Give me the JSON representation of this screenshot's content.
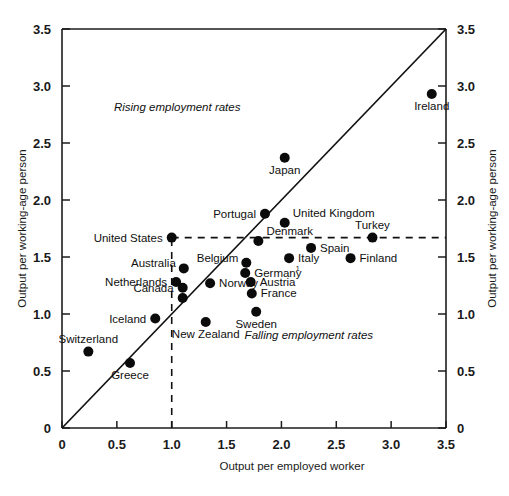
{
  "chart_data": {
    "type": "scatter",
    "title": "",
    "xlabel": "Output per employed worker",
    "ylabel": "Output per working-age person",
    "ylabel_right": "Output per working-age person",
    "xlim": [
      0,
      3.5
    ],
    "ylim": [
      0,
      3.5
    ],
    "xticks": [
      "0",
      "0.5",
      "1.0",
      "1.5",
      "2.0",
      "2.5",
      "3.0",
      "3.5"
    ],
    "xtick_values": [
      0,
      0.5,
      1.0,
      1.5,
      2.0,
      2.5,
      3.0,
      3.5
    ],
    "yticks": [
      "0",
      "0.5",
      "1.0",
      "1.5",
      "2.0",
      "2.5",
      "3.0",
      "3.5"
    ],
    "ytick_values": [
      0,
      0.5,
      1.0,
      1.5,
      2.0,
      2.5,
      3.0,
      3.5
    ],
    "grid": false,
    "legend": "none",
    "reference_line": {
      "name": "45-degree-line",
      "from": [
        0,
        0
      ],
      "to": [
        3.5,
        3.5
      ],
      "style": "solid"
    },
    "guide_lines": [
      {
        "name": "united-states-horizontal-guide",
        "orientation": "horizontal",
        "value": 1.67,
        "from_x": 1.0,
        "to_x": 3.5,
        "style": "dashed"
      },
      {
        "name": "united-states-vertical-guide",
        "orientation": "vertical",
        "value": 1.0,
        "from_y": 0.0,
        "to_y": 1.67,
        "style": "dashed"
      }
    ],
    "annotations": [
      {
        "text": "Rising employment rates",
        "x": 1.05,
        "y": 2.78,
        "style": "italic"
      },
      {
        "text": "Falling employment rates",
        "x": 2.25,
        "y": 0.78,
        "style": "italic"
      }
    ],
    "points": [
      {
        "label": "Ireland",
        "x": 3.37,
        "y": 2.93,
        "label_pos": "below"
      },
      {
        "label": "Japan",
        "x": 2.03,
        "y": 2.37,
        "label_pos": "below"
      },
      {
        "label": "Portugal",
        "x": 1.85,
        "y": 1.88,
        "label_pos": "left"
      },
      {
        "label": "United Kingdom",
        "x": 2.03,
        "y": 1.8,
        "label_pos": "right-above"
      },
      {
        "label": "Denmark",
        "x": 1.79,
        "y": 1.64,
        "label_pos": "right-above"
      },
      {
        "label": "Turkey",
        "x": 2.83,
        "y": 1.67,
        "label_pos": "above"
      },
      {
        "label": "United States",
        "x": 1.0,
        "y": 1.67,
        "label_pos": "left"
      },
      {
        "label": "Spain",
        "x": 2.27,
        "y": 1.58,
        "label_pos": "right"
      },
      {
        "label": "Italy",
        "x": 2.07,
        "y": 1.49,
        "label_pos": "right"
      },
      {
        "label": "Finland",
        "x": 2.63,
        "y": 1.49,
        "label_pos": "right"
      },
      {
        "label": "Belgium",
        "x": 1.68,
        "y": 1.45,
        "label_pos": "left-above"
      },
      {
        "label": "Germany",
        "x": 1.67,
        "y": 1.36,
        "label_pos": "right",
        "footnote": "1"
      },
      {
        "label": "Australia",
        "x": 1.11,
        "y": 1.4,
        "label_pos": "left-above"
      },
      {
        "label": "Austria",
        "x": 1.72,
        "y": 1.28,
        "label_pos": "right"
      },
      {
        "label": "Netherlands",
        "x": 1.04,
        "y": 1.28,
        "label_pos": "left"
      },
      {
        "label": "Norway",
        "x": 1.35,
        "y": 1.27,
        "label_pos": "right"
      },
      {
        "label": "France",
        "x": 1.73,
        "y": 1.18,
        "label_pos": "right"
      },
      {
        "label": "Canada",
        "x": 1.1,
        "y": 1.23,
        "label_pos": "left"
      },
      {
        "label": "",
        "x": 1.1,
        "y": 1.14,
        "label_pos": "none"
      },
      {
        "label": "Iceland",
        "x": 0.85,
        "y": 0.96,
        "label_pos": "left"
      },
      {
        "label": "Sweden",
        "x": 1.77,
        "y": 1.02,
        "label_pos": "below"
      },
      {
        "label": "New Zealand",
        "x": 1.31,
        "y": 0.93,
        "label_pos": "below"
      },
      {
        "label": "Switzerland",
        "x": 0.24,
        "y": 0.67,
        "label_pos": "above"
      },
      {
        "label": "Greece",
        "x": 0.62,
        "y": 0.57,
        "label_pos": "below"
      }
    ]
  }
}
